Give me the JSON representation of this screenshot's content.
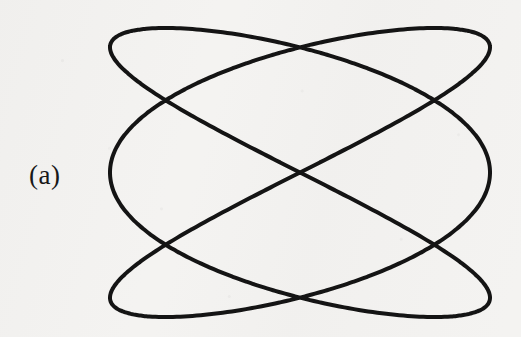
{
  "figure": {
    "panel_label": "(a)",
    "caption": "",
    "background_color": "#f4f3f1",
    "ink_color": "#141414",
    "stroke_width": 4,
    "canvas": {
      "width": 521,
      "height": 337
    }
  },
  "chart_data": {
    "type": "line",
    "title": "",
    "subtitle": "",
    "xlabel": "",
    "ylabel": "",
    "annotations": [
      {
        "text": "(a)",
        "x": 52,
        "y": 182,
        "role": "panel-label"
      }
    ],
    "grid": false,
    "legend": null,
    "axes_visible": false,
    "curve": {
      "name": "Lissajous 3:2",
      "parametric": true,
      "x_expression": "cx + A * sin(3*t + phase_x)",
      "y_expression": "cy - B * sin(2*t + phase_y)",
      "center": {
        "x": 300,
        "y": 172.5
      },
      "amplitude_x": 190,
      "amplitude_y": 144.5,
      "frequency_ratio": "3:2",
      "phase_x_deg": 90,
      "phase_y_deg": 0,
      "t_range_deg": [
        0,
        360
      ],
      "closed": true,
      "samples": 720
    },
    "xlim": [
      110,
      490
    ],
    "ylim": [
      28,
      317
    ],
    "key_points": {
      "extent_left_x": 110,
      "extent_right_x": 490,
      "extent_top_y": 28,
      "extent_bottom_y": 317,
      "crossings": [
        {
          "label": "center",
          "x": 300,
          "y": 172
        },
        {
          "label": "upper-left",
          "x": 205,
          "y": 72
        },
        {
          "label": "upper-right",
          "x": 390,
          "y": 72
        },
        {
          "label": "lower-left",
          "x": 205,
          "y": 272
        },
        {
          "label": "lower-right",
          "x": 390,
          "y": 272
        },
        {
          "label": "left-waist",
          "x": 137,
          "y": 173
        },
        {
          "label": "right-waist",
          "x": 462,
          "y": 173
        }
      ],
      "lobe_peaks": [
        {
          "label": "top-left-lobe",
          "x": 138,
          "y": 30
        },
        {
          "label": "top-arc",
          "x": 300,
          "y": 28
        },
        {
          "label": "top-right-lobe",
          "x": 458,
          "y": 30
        },
        {
          "label": "bottom-left-lobe",
          "x": 138,
          "y": 315
        },
        {
          "label": "bottom-arc",
          "x": 300,
          "y": 317
        },
        {
          "label": "bottom-right-lobe",
          "x": 458,
          "y": 315
        }
      ]
    }
  }
}
